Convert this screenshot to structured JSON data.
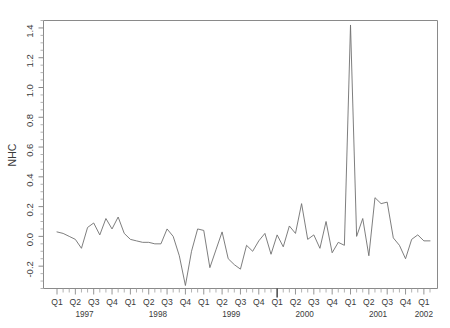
{
  "chart_data": {
    "type": "line",
    "title": "",
    "xlabel": "",
    "ylabel": "NHC",
    "ylim": [
      -0.35,
      1.45
    ],
    "yticks": [
      -0.2,
      0.0,
      0.2,
      0.4,
      0.6,
      0.8,
      1.0,
      1.2,
      1.4
    ],
    "ytick_labels": [
      "-0.2",
      "0.0",
      "0.2",
      "0.4",
      "0.6",
      "0.8",
      "1.0",
      "1.2",
      "1.4"
    ],
    "grid": false,
    "legend": "none",
    "x_axis": {
      "quarter_labels": [
        "Q1",
        "Q2",
        "Q3",
        "Q4",
        "Q1",
        "Q2",
        "Q3",
        "Q4",
        "Q1",
        "Q2",
        "Q3",
        "Q4",
        "Q1",
        "Q2",
        "Q3",
        "Q4",
        "Q1",
        "Q2",
        "Q3",
        "Q4",
        "Q1"
      ],
      "year_labels": [
        "1997",
        "1998",
        "1999",
        "2000",
        "2001",
        "2002"
      ],
      "frequency": "monthly",
      "x_start": "1997-01",
      "x_end": "2002-02"
    },
    "series": [
      {
        "name": "NHC",
        "color": "#6f6f6f",
        "x": [
          "1997-01",
          "1997-02",
          "1997-03",
          "1997-04",
          "1997-05",
          "1997-06",
          "1997-07",
          "1997-08",
          "1997-09",
          "1997-10",
          "1997-11",
          "1997-12",
          "1998-01",
          "1998-02",
          "1998-03",
          "1998-04",
          "1998-05",
          "1998-06",
          "1998-07",
          "1998-08",
          "1998-09",
          "1998-10",
          "1998-11",
          "1998-12",
          "1999-01",
          "1999-02",
          "1999-03",
          "1999-04",
          "1999-05",
          "1999-06",
          "1999-07",
          "1999-08",
          "1999-09",
          "1999-10",
          "1999-11",
          "1999-12",
          "2000-01",
          "2000-02",
          "2000-03",
          "2000-04",
          "2000-05",
          "2000-06",
          "2000-07",
          "2000-08",
          "2000-09",
          "2000-10",
          "2000-11",
          "2000-12",
          "2001-01",
          "2001-02",
          "2001-03",
          "2001-04",
          "2001-05",
          "2001-06",
          "2001-07",
          "2001-08",
          "2001-09",
          "2001-10",
          "2001-11",
          "2001-12",
          "2002-01",
          "2002-02"
        ],
        "values": [
          0.03,
          0.02,
          0.0,
          -0.02,
          -0.08,
          0.06,
          0.09,
          0.01,
          0.12,
          0.05,
          0.13,
          0.02,
          -0.02,
          -0.03,
          -0.04,
          -0.04,
          -0.05,
          -0.05,
          0.05,
          0.0,
          -0.13,
          -0.33,
          -0.1,
          0.05,
          0.04,
          -0.21,
          -0.09,
          0.03,
          -0.15,
          -0.19,
          -0.22,
          -0.06,
          -0.1,
          -0.03,
          0.02,
          -0.12,
          0.01,
          -0.07,
          0.07,
          0.02,
          0.22,
          -0.02,
          0.01,
          -0.08,
          0.1,
          -0.11,
          -0.04,
          -0.06,
          1.42,
          0.0,
          0.12,
          -0.13,
          0.26,
          0.22,
          0.23,
          -0.01,
          -0.06,
          -0.15,
          -0.02,
          0.01,
          -0.03,
          -0.03
        ]
      }
    ],
    "annotations": {
      "peak_value": 1.42,
      "peak_x": "2001-01"
    }
  },
  "axis": {
    "y_title": "NHC"
  }
}
